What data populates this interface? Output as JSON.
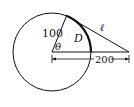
{
  "diagram": {
    "labels": {
      "radius": "100",
      "angle": "θ",
      "region": "D",
      "tangent_line": "ℓ",
      "distance": "200"
    },
    "geometry": {
      "circle_center": [
        52,
        52
      ],
      "circle_radius": 39,
      "tangent_point": [
        67,
        15
      ],
      "external_point": [
        129,
        52
      ],
      "dimension_line_y": 59
    },
    "colors": {
      "stroke": "#111111",
      "background": "#ffffff"
    }
  }
}
